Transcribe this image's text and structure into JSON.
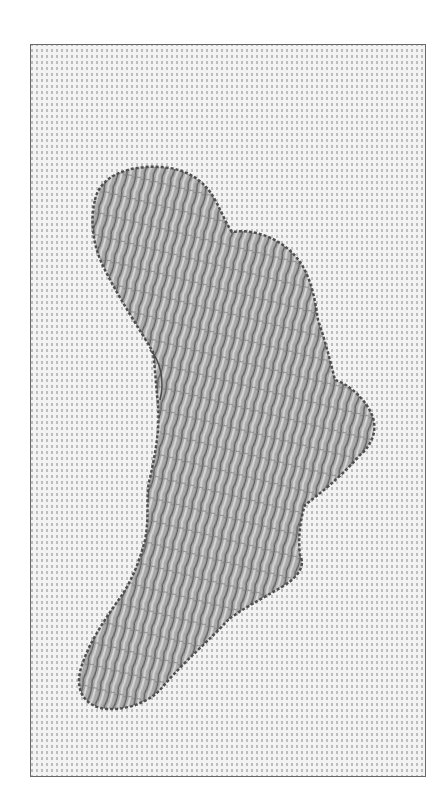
{
  "illustration": {
    "subject": "embroidery-fill-stitch-sample",
    "colors": {
      "background": "#ffffff",
      "frame_border": "#6a6a6a",
      "fabric_base": "#f2f2f2",
      "fabric_dot": "#b8b8b8",
      "thread_fill": "#a9a9a9",
      "thread_dark": "#5a5a5a",
      "thread_light": "#d6d6d6"
    }
  }
}
